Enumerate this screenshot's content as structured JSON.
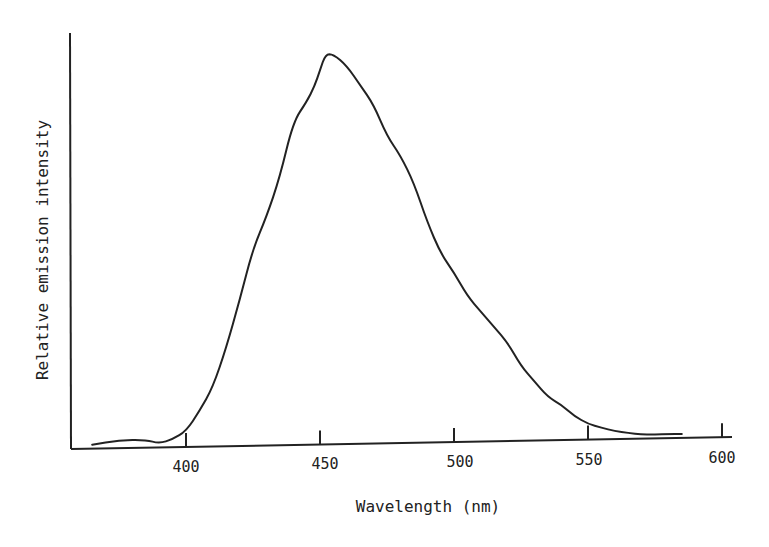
{
  "chart_data": {
    "type": "line",
    "title": "",
    "xlabel": "Wavelength (nm)",
    "ylabel": "Relative emission intensity",
    "xlim": [
      360,
      605
    ],
    "ylim": [
      0,
      1
    ],
    "x_ticks": [
      400,
      450,
      500,
      550,
      600
    ],
    "y_ticks": [],
    "grid": false,
    "legend": null,
    "series": [
      {
        "name": "Emission spectrum",
        "x": [
          365,
          375,
          385,
          390,
          395,
          400,
          405,
          410,
          415,
          420,
          425,
          430,
          435,
          440,
          445,
          448,
          450,
          452,
          455,
          460,
          465,
          470,
          475,
          480,
          485,
          490,
          495,
          500,
          505,
          510,
          515,
          520,
          525,
          530,
          535,
          540,
          545,
          550,
          555,
          560,
          565,
          570,
          575,
          580,
          585
        ],
        "values": [
          0.01,
          0.02,
          0.02,
          0.01,
          0.02,
          0.04,
          0.09,
          0.15,
          0.25,
          0.37,
          0.5,
          0.58,
          0.68,
          0.82,
          0.87,
          0.91,
          0.95,
          0.99,
          0.99,
          0.96,
          0.91,
          0.86,
          0.78,
          0.73,
          0.66,
          0.56,
          0.48,
          0.43,
          0.37,
          0.33,
          0.29,
          0.25,
          0.19,
          0.15,
          0.11,
          0.09,
          0.06,
          0.04,
          0.03,
          0.02,
          0.015,
          0.01,
          0.01,
          0.01,
          0.01
        ]
      }
    ]
  },
  "axes": {
    "x_title": "Wavelength (nm)",
    "y_title": "Relative emission intensity",
    "x_tick_labels": [
      "400",
      "450",
      "500",
      "550",
      "600"
    ]
  }
}
